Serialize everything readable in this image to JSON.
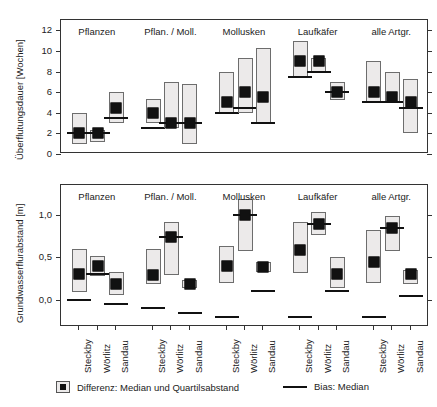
{
  "figure": {
    "legend": {
      "median_box_label": "Differenz: Median und Quartilsabstand",
      "bias_label": "Bias: Median"
    },
    "x_categories": [
      "Steckby",
      "Wörlitz",
      "Sandau"
    ],
    "group_labels": [
      "Pflanzen",
      "Pflan. / Moll.",
      "Mollusken",
      "Laufkäfer",
      "alle Artgr."
    ],
    "colors": {
      "box_fill": "#eceaea",
      "box_stroke": "#6d6d6d",
      "marker": "#111111",
      "frame": "#333333"
    }
  },
  "chart_data": [
    {
      "type": "bar",
      "id": "panel-top",
      "title": "",
      "ylabel": "Überflutungsdauer [Wochen]",
      "xlabel": "",
      "ylim": [
        0,
        13
      ],
      "yticks": [
        0,
        2,
        4,
        6,
        8,
        10,
        12
      ],
      "ytick_labels": [
        "0",
        "2",
        "4",
        "6",
        "8",
        "10",
        "12"
      ],
      "grid": false,
      "groups": [
        "Pflanzen",
        "Pflan. / Moll.",
        "Mollusken",
        "Laufkäfer",
        "alle Artgr."
      ],
      "categories": [
        "Steckby",
        "Wörlitz",
        "Sandau"
      ],
      "series": [
        {
          "name": "Differenz: Median und Quartilsabstand",
          "points": [
            {
              "group": "Pflanzen",
              "category": "Steckby",
              "median": 2.0,
              "q1": 1.0,
              "q3": 4.0,
              "bias": 2.0
            },
            {
              "group": "Pflanzen",
              "category": "Wörlitz",
              "median": 2.0,
              "q1": 1.2,
              "q3": 2.3,
              "bias": 2.0
            },
            {
              "group": "Pflanzen",
              "category": "Sandau",
              "median": 4.5,
              "q1": 3.0,
              "q3": 6.0,
              "bias": 3.5
            },
            {
              "group": "Pflan. / Moll.",
              "category": "Steckby",
              "median": 4.0,
              "q1": 3.0,
              "q3": 5.3,
              "bias": 2.5
            },
            {
              "group": "Pflan. / Moll.",
              "category": "Wörlitz",
              "median": 3.0,
              "q1": 2.5,
              "q3": 7.0,
              "bias": 3.0
            },
            {
              "group": "Pflan. / Moll.",
              "category": "Sandau",
              "median": 3.0,
              "q1": 1.0,
              "q3": 6.8,
              "bias": 3.0
            },
            {
              "group": "Mollusken",
              "category": "Steckby",
              "median": 5.0,
              "q1": 4.0,
              "q3": 8.0,
              "bias": 4.0
            },
            {
              "group": "Mollusken",
              "category": "Wörlitz",
              "median": 6.0,
              "q1": 4.0,
              "q3": 9.3,
              "bias": 4.5
            },
            {
              "group": "Mollusken",
              "category": "Sandau",
              "median": 5.5,
              "q1": 3.0,
              "q3": 10.3,
              "bias": 3.0
            },
            {
              "group": "Laufkäfer",
              "category": "Steckby",
              "median": 9.0,
              "q1": 7.5,
              "q3": 11.0,
              "bias": 7.5
            },
            {
              "group": "Laufkäfer",
              "category": "Wörlitz",
              "median": 9.0,
              "q1": 8.0,
              "q3": 9.3,
              "bias": 8.0
            },
            {
              "group": "Laufkäfer",
              "category": "Sandau",
              "median": 6.0,
              "q1": 5.2,
              "q3": 7.0,
              "bias": 6.0
            },
            {
              "group": "alle Artgr.",
              "category": "Steckby",
              "median": 6.0,
              "q1": 5.0,
              "q3": 9.0,
              "bias": 5.0
            },
            {
              "group": "alle Artgr.",
              "category": "Wörlitz",
              "median": 5.5,
              "q1": 5.0,
              "q3": 8.0,
              "bias": 5.0
            },
            {
              "group": "alle Artgr.",
              "category": "Sandau",
              "median": 5.0,
              "q1": 2.0,
              "q3": 7.3,
              "bias": 4.5
            }
          ]
        }
      ]
    },
    {
      "type": "bar",
      "id": "panel-bottom",
      "title": "",
      "ylabel": "Grundwasserflurabstand [m]",
      "xlabel": "",
      "ylim": [
        -0.32,
        1.35
      ],
      "yticks": [
        0.0,
        0.5,
        1.0
      ],
      "ytick_labels": [
        "0,0",
        "0,5",
        "1,0"
      ],
      "grid": false,
      "groups": [
        "Pflanzen",
        "Pflan. / Moll.",
        "Mollusken",
        "Laufkäfer",
        "alle Artgr."
      ],
      "categories": [
        "Steckby",
        "Wörlitz",
        "Sandau"
      ],
      "series": [
        {
          "name": "Differenz: Median und Quartilsabstand",
          "points": [
            {
              "group": "Pflanzen",
              "category": "Steckby",
              "median": 0.3,
              "q1": 0.09,
              "q3": 0.6,
              "bias": 0.0
            },
            {
              "group": "Pflanzen",
              "category": "Wörlitz",
              "median": 0.4,
              "q1": 0.28,
              "q3": 0.52,
              "bias": 0.3
            },
            {
              "group": "Pflanzen",
              "category": "Sandau",
              "median": 0.19,
              "q1": 0.06,
              "q3": 0.33,
              "bias": -0.05
            },
            {
              "group": "Pflan. / Moll.",
              "category": "Steckby",
              "median": 0.29,
              "q1": 0.19,
              "q3": 0.6,
              "bias": -0.1
            },
            {
              "group": "Pflan. / Moll.",
              "category": "Wörlitz",
              "median": 0.74,
              "q1": 0.29,
              "q3": 0.92,
              "bias": 0.74
            },
            {
              "group": "Pflan. / Moll.",
              "category": "Sandau",
              "median": 0.19,
              "q1": 0.14,
              "q3": 0.23,
              "bias": -0.15
            },
            {
              "group": "Mollusken",
              "category": "Steckby",
              "median": 0.4,
              "q1": 0.2,
              "q3": 0.63,
              "bias": -0.2
            },
            {
              "group": "Mollusken",
              "category": "Wörlitz",
              "median": 1.0,
              "q1": 0.57,
              "q3": 1.19,
              "bias": 1.0
            },
            {
              "group": "Mollusken",
              "category": "Sandau",
              "median": 0.39,
              "q1": 0.33,
              "q3": 0.45,
              "bias": 0.1
            },
            {
              "group": "Laufkäfer",
              "category": "Steckby",
              "median": 0.59,
              "q1": 0.31,
              "q3": 0.92,
              "bias": -0.2
            },
            {
              "group": "Laufkäfer",
              "category": "Wörlitz",
              "median": 0.89,
              "q1": 0.76,
              "q3": 1.03,
              "bias": 0.89
            },
            {
              "group": "Laufkäfer",
              "category": "Sandau",
              "median": 0.3,
              "q1": 0.14,
              "q3": 0.5,
              "bias": 0.1
            },
            {
              "group": "alle Artgr.",
              "category": "Steckby",
              "median": 0.44,
              "q1": 0.2,
              "q3": 0.82,
              "bias": -0.2
            },
            {
              "group": "alle Artgr.",
              "category": "Wörlitz",
              "median": 0.84,
              "q1": 0.57,
              "q3": 0.99,
              "bias": 0.84
            },
            {
              "group": "alle Artgr.",
              "category": "Sandau",
              "median": 0.3,
              "q1": 0.18,
              "q3": 0.35,
              "bias": 0.04
            }
          ]
        }
      ]
    }
  ]
}
